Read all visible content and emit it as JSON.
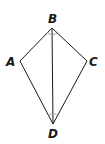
{
  "diagram": {
    "type": "kite",
    "points": {
      "A": {
        "label": "A",
        "x": 20,
        "y": 61
      },
      "B": {
        "label": "B",
        "x": 52,
        "y": 28
      },
      "C": {
        "label": "C",
        "x": 87,
        "y": 61
      },
      "D": {
        "label": "D",
        "x": 53,
        "y": 124
      }
    },
    "segments": [
      "AB",
      "BC",
      "CD",
      "DA",
      "BD"
    ],
    "angle_marks": [
      "ABD",
      "DBC",
      "ADB",
      "BDC"
    ],
    "colors": {
      "line": "#1a1a1a",
      "arc": "#999999"
    }
  }
}
